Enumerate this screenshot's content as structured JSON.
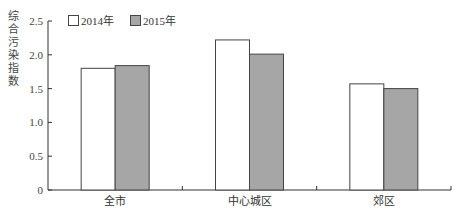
{
  "chart_data": {
    "type": "bar",
    "title": "",
    "xlabel": "",
    "ylabel": "综合污染指数",
    "categories": [
      "全市",
      "中心城区",
      "郊区"
    ],
    "series": [
      {
        "name": "2014年",
        "values": [
          1.8,
          2.22,
          1.57
        ],
        "color": "#ffffff"
      },
      {
        "name": "2015年",
        "values": [
          1.84,
          2.01,
          1.5
        ],
        "color": "#a6a6a6"
      }
    ],
    "ylim": [
      0,
      2.5
    ],
    "yticks": [
      0,
      0.5,
      1.0,
      1.5,
      2.0,
      2.5
    ],
    "ytick_labels": [
      "0",
      "0.5",
      "1.0",
      "1.5",
      "2.0",
      "2.5"
    ],
    "grid": false,
    "legend_position": "top-left inside"
  },
  "legend": {
    "items": [
      {
        "label": "2014年",
        "color": "#ffffff"
      },
      {
        "label": "2015年",
        "color": "#a6a6a6"
      }
    ]
  },
  "axis": {
    "ylabel_chars": [
      "综",
      "合",
      "污",
      "染",
      "指",
      "数"
    ]
  }
}
